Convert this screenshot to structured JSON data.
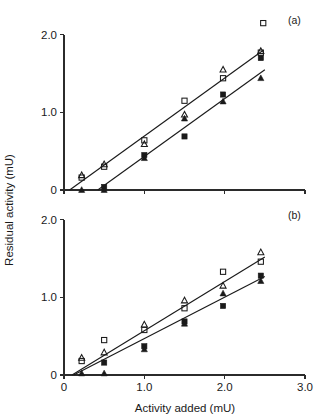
{
  "figure": {
    "width": 327,
    "height": 419,
    "background": "#ffffff",
    "ink_color": "#1a1a1a",
    "axis_title_x": "Activity added (mU)",
    "axis_title_y": "Residual activity (mU)"
  },
  "chart_data": [
    {
      "type": "scatter",
      "panel": "(a)",
      "title": "",
      "xlabel": "Activity added (mU)",
      "ylabel": "Residual activity (mU)",
      "xlim": [
        0,
        3.0
      ],
      "ylim": [
        0,
        2.1
      ],
      "xticks": [
        0,
        1.0,
        2.0,
        3.0
      ],
      "xticklabels": [
        "0",
        "1.0",
        "2.0",
        "3.0"
      ],
      "yticks": [
        0,
        1.0,
        2.0
      ],
      "yticklabels": [
        "0",
        "1.0",
        "2.0"
      ],
      "grid": false,
      "legend": "none",
      "series": [
        {
          "name": "open-triangle",
          "marker": "open-triangle",
          "points": [
            {
              "x": 0.22,
              "y": 0.19
            },
            {
              "x": 0.5,
              "y": 0.33
            },
            {
              "x": 1.0,
              "y": 0.59
            },
            {
              "x": 1.5,
              "y": 0.97
            },
            {
              "x": 1.98,
              "y": 1.55
            },
            {
              "x": 2.45,
              "y": 1.79
            }
          ]
        },
        {
          "name": "open-square",
          "marker": "open-square",
          "points": [
            {
              "x": 0.22,
              "y": 0.16
            },
            {
              "x": 0.5,
              "y": 0.3
            },
            {
              "x": 1.0,
              "y": 0.64
            },
            {
              "x": 1.5,
              "y": 1.15
            },
            {
              "x": 1.98,
              "y": 1.44
            },
            {
              "x": 2.45,
              "y": 1.77
            },
            {
              "x": 2.48,
              "y": 2.15
            }
          ]
        },
        {
          "name": "filled-square",
          "marker": "filled-square",
          "points": [
            {
              "x": 0.5,
              "y": 0.04
            },
            {
              "x": 1.0,
              "y": 0.45
            },
            {
              "x": 1.5,
              "y": 0.69
            },
            {
              "x": 1.98,
              "y": 1.23
            },
            {
              "x": 2.45,
              "y": 1.7
            }
          ]
        },
        {
          "name": "filled-triangle",
          "marker": "filled-triangle",
          "points": [
            {
              "x": 0.22,
              "y": 0.0
            },
            {
              "x": 0.5,
              "y": 0.0
            },
            {
              "x": 1.0,
              "y": 0.41
            },
            {
              "x": 1.5,
              "y": 0.92
            },
            {
              "x": 1.98,
              "y": 1.14
            },
            {
              "x": 2.45,
              "y": 1.44
            }
          ]
        }
      ],
      "fit_lines": [
        {
          "name": "upper-fit",
          "x1": 0.07,
          "y1": 0.0,
          "x2": 2.48,
          "y2": 1.8
        },
        {
          "name": "lower-fit",
          "x1": 0.42,
          "y1": 0.0,
          "x2": 2.5,
          "y2": 1.55
        }
      ]
    },
    {
      "type": "scatter",
      "panel": "(b)",
      "title": "",
      "xlabel": "Activity added (mU)",
      "ylabel": "Residual activity (mU)",
      "xlim": [
        0,
        3.0
      ],
      "ylim": [
        0,
        2.1
      ],
      "xticks": [
        0,
        1.0,
        2.0,
        3.0
      ],
      "xticklabels": [
        "0",
        "1.0",
        "2.0",
        "3.0"
      ],
      "yticks": [
        0,
        1.0,
        2.0
      ],
      "yticklabels": [
        "0",
        "1.0",
        "2.0"
      ],
      "grid": false,
      "legend": "none",
      "series": [
        {
          "name": "open-triangle",
          "marker": "open-triangle",
          "points": [
            {
              "x": 0.22,
              "y": 0.22
            },
            {
              "x": 0.5,
              "y": 0.29
            },
            {
              "x": 1.0,
              "y": 0.65
            },
            {
              "x": 1.5,
              "y": 0.96
            },
            {
              "x": 1.98,
              "y": 1.15
            },
            {
              "x": 2.45,
              "y": 1.58
            }
          ]
        },
        {
          "name": "open-square",
          "marker": "open-square",
          "points": [
            {
              "x": 0.22,
              "y": 0.18
            },
            {
              "x": 0.5,
              "y": 0.45
            },
            {
              "x": 1.0,
              "y": 0.58
            },
            {
              "x": 1.5,
              "y": 0.86
            },
            {
              "x": 1.98,
              "y": 1.33
            },
            {
              "x": 2.45,
              "y": 1.46
            }
          ]
        },
        {
          "name": "filled-square",
          "marker": "filled-square",
          "points": [
            {
              "x": 0.5,
              "y": 0.16
            },
            {
              "x": 1.0,
              "y": 0.37
            },
            {
              "x": 1.5,
              "y": 0.69
            },
            {
              "x": 1.98,
              "y": 0.89
            },
            {
              "x": 2.45,
              "y": 1.28
            }
          ]
        },
        {
          "name": "filled-triangle",
          "marker": "filled-triangle",
          "points": [
            {
              "x": 0.22,
              "y": 0.02
            },
            {
              "x": 0.5,
              "y": 0.02
            },
            {
              "x": 1.0,
              "y": 0.33
            },
            {
              "x": 1.5,
              "y": 0.66
            },
            {
              "x": 1.98,
              "y": 1.05
            },
            {
              "x": 2.45,
              "y": 1.21
            }
          ]
        }
      ],
      "fit_lines": [
        {
          "name": "upper-fit",
          "x1": 0.1,
          "y1": 0.0,
          "x2": 2.5,
          "y2": 1.52
        },
        {
          "name": "lower-fit",
          "x1": 0.12,
          "y1": 0.0,
          "x2": 2.5,
          "y2": 1.27
        }
      ]
    }
  ]
}
